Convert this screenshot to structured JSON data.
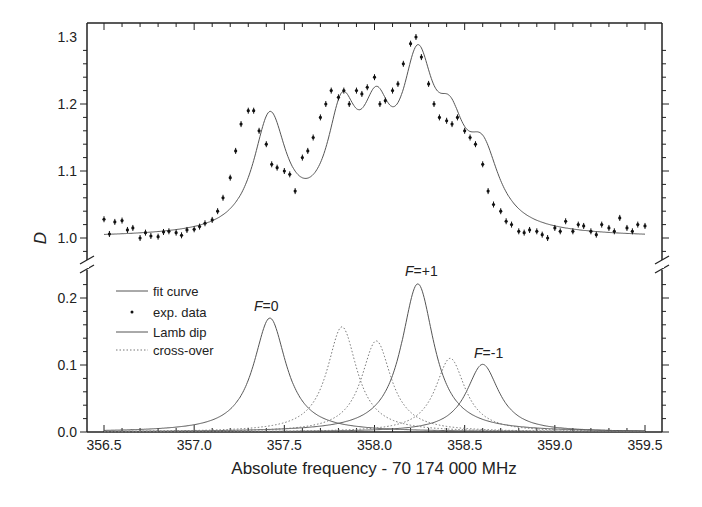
{
  "chart_data": {
    "type": "line",
    "title": "",
    "xlabel": "Absolute frequency - 70 174 000 MHz",
    "xlim": [
      356.5,
      359.5
    ],
    "xticks": [
      "356.5",
      "357.0",
      "357.5",
      "358.0",
      "358.5",
      "359.0",
      "359.5"
    ],
    "x_minor_step": 0.1,
    "grid": false,
    "panels": [
      {
        "name": "upper",
        "ylabel": "D",
        "ylim": [
          0.97,
          1.32
        ],
        "yticks": [
          "1.0",
          "1.1",
          "1.2",
          "1.3"
        ],
        "series": [
          {
            "name": "fit curve",
            "style": "solid",
            "baseline": 1.0,
            "description": "baseline + sum of Lamb dip and cross-over Lorentzians"
          },
          {
            "name": "exp. data",
            "style": "points",
            "x": [
              356.5,
              356.53,
              356.56,
              356.6,
              356.63,
              356.66,
              356.7,
              356.73,
              356.76,
              356.8,
              356.83,
              356.86,
              356.9,
              356.93,
              356.96,
              357.0,
              357.03,
              357.06,
              357.1,
              357.13,
              357.16,
              357.2,
              357.23,
              357.26,
              357.3,
              357.33,
              357.36,
              357.4,
              357.43,
              357.46,
              357.5,
              357.53,
              357.56,
              357.6,
              357.63,
              357.66,
              357.7,
              357.73,
              357.76,
              357.8,
              357.83,
              357.86,
              357.9,
              357.93,
              357.96,
              358.0,
              358.03,
              358.06,
              358.1,
              358.13,
              358.16,
              358.2,
              358.23,
              358.26,
              358.3,
              358.33,
              358.36,
              358.4,
              358.43,
              358.46,
              358.5,
              358.53,
              358.56,
              358.6,
              358.63,
              358.66,
              358.7,
              358.73,
              358.76,
              358.8,
              358.83,
              358.86,
              358.9,
              358.93,
              358.96,
              359.0,
              359.03,
              359.06,
              359.1,
              359.13,
              359.16,
              359.2,
              359.23,
              359.26,
              359.3,
              359.33,
              359.36,
              359.4,
              359.43,
              359.46,
              359.5
            ],
            "y": [
              1.028,
              1.006,
              1.024,
              1.026,
              1.012,
              1.015,
              1.0,
              1.008,
              1.003,
              1.002,
              1.009,
              1.01,
              1.008,
              1.004,
              1.012,
              1.013,
              1.017,
              1.022,
              1.027,
              1.04,
              1.06,
              1.09,
              1.13,
              1.17,
              1.19,
              1.19,
              1.16,
              1.14,
              1.11,
              1.105,
              1.1,
              1.095,
              1.07,
              1.12,
              1.13,
              1.15,
              1.18,
              1.2,
              1.22,
              1.21,
              1.22,
              1.2,
              1.22,
              1.215,
              1.225,
              1.24,
              1.2,
              1.205,
              1.22,
              1.23,
              1.26,
              1.29,
              1.3,
              1.27,
              1.23,
              1.2,
              1.18,
              1.175,
              1.17,
              1.18,
              1.16,
              1.15,
              1.14,
              1.11,
              1.07,
              1.05,
              1.04,
              1.025,
              1.02,
              1.01,
              1.008,
              1.012,
              1.01,
              1.005,
              1.0,
              1.015,
              1.01,
              1.025,
              1.01,
              1.02,
              1.018,
              1.01,
              1.005,
              1.02,
              1.015,
              1.01,
              1.03,
              1.015,
              1.01,
              1.02,
              1.018
            ]
          }
        ]
      },
      {
        "name": "lower",
        "ylabel": "",
        "ylim": [
          0.0,
          0.23
        ],
        "yticks": [
          "0.0",
          "0.1",
          "0.2"
        ],
        "series": [
          {
            "name": "Lamb dip",
            "label": "F=0",
            "style": "solid",
            "center": 357.42,
            "height": 0.17,
            "hwhm": 0.11
          },
          {
            "name": "Lamb dip",
            "label": "F=+1",
            "style": "solid",
            "center": 358.24,
            "height": 0.221,
            "hwhm": 0.11
          },
          {
            "name": "Lamb dip",
            "label": "F=-1",
            "style": "solid",
            "center": 358.6,
            "height": 0.101,
            "hwhm": 0.11
          },
          {
            "name": "cross-over",
            "label": "",
            "style": "dotted",
            "center": 357.82,
            "height": 0.157,
            "hwhm": 0.1
          },
          {
            "name": "cross-over",
            "label": "",
            "style": "dotted",
            "center": 358.01,
            "height": 0.136,
            "hwhm": 0.1
          },
          {
            "name": "cross-over",
            "label": "",
            "style": "dotted",
            "center": 358.42,
            "height": 0.11,
            "hwhm": 0.1
          }
        ],
        "annotations": [
          {
            "text": "F=0",
            "x": 357.42,
            "y": 0.195
          },
          {
            "text": "F=+1",
            "x": 358.24,
            "y": 0.245
          },
          {
            "text": "F=-1",
            "x": 358.62,
            "y": 0.125
          }
        ]
      }
    ],
    "legend": {
      "position": "upper-left of lower panel",
      "entries": [
        {
          "label": "fit curve",
          "style": "solid"
        },
        {
          "label": "exp. data",
          "style": "point"
        },
        {
          "label": "Lamb dip",
          "style": "solid"
        },
        {
          "label": "cross-over",
          "style": "dotted"
        }
      ]
    }
  },
  "labels": {
    "xlabel": "Absolute frequency - 70 174 000 MHz",
    "ylabel": "D",
    "legend_fit": "fit curve",
    "legend_exp": "exp. data",
    "legend_lamb": "Lamb dip",
    "legend_cross": "cross-over",
    "anno_F0_prefix": "F",
    "anno_F0_suffix": "=0",
    "anno_Fp1_prefix": "F",
    "anno_Fp1_suffix": "=+1",
    "anno_Fm1_prefix": "F",
    "anno_Fm1_suffix": "=-1"
  },
  "colors": {
    "line": "#555555",
    "axis": "#222222",
    "point": "#111111"
  }
}
